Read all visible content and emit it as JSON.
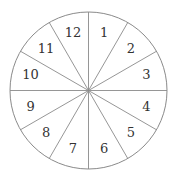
{
  "diagram": {
    "type": "spinner-wheel",
    "sectors": 12,
    "colors": {
      "stroke": "#8a8a8a",
      "text": "#333333",
      "background": "#ffffff"
    },
    "labels": [
      "1",
      "2",
      "3",
      "4",
      "5",
      "6",
      "7",
      "8",
      "9",
      "10",
      "11",
      "12"
    ]
  }
}
